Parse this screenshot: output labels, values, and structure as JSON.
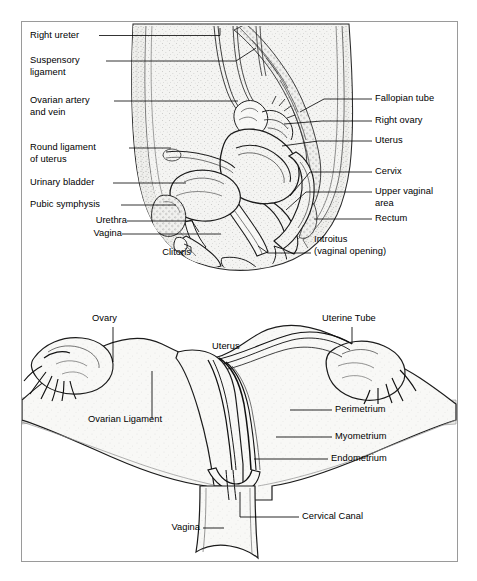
{
  "figure": {
    "kind": "anatomical-diagram",
    "title_visible": false,
    "panels": [
      {
        "id": "sagittal",
        "name": "Female pelvis, midsagittal section"
      },
      {
        "id": "coronal",
        "name": "Uterus, uterine tubes and ovaries, coronal section"
      }
    ],
    "colors": {
      "frame_border": "#9a9a9a",
      "background": "#ffffff",
      "ink": "#000000",
      "tissue_fill": "#f2f2f0",
      "shade_fill": "#e9e9e6",
      "leader_line": "#000000"
    }
  },
  "sagittal": {
    "left_labels": [
      {
        "key": "right_ureter",
        "text": "Right ureter"
      },
      {
        "key": "suspensory_ligament_l1",
        "text": "Suspensory"
      },
      {
        "key": "suspensory_ligament_l2",
        "text": "ligament"
      },
      {
        "key": "ovarian_artery_l1",
        "text": "Ovarian artery"
      },
      {
        "key": "ovarian_artery_l2",
        "text": "and vein"
      },
      {
        "key": "round_ligament_l1",
        "text": "Round ligament"
      },
      {
        "key": "round_ligament_l2",
        "text": "of uterus"
      },
      {
        "key": "urinary_bladder",
        "text": "Urinary bladder"
      },
      {
        "key": "pubic_symphysis",
        "text": "Pubic symphysis"
      },
      {
        "key": "urethra",
        "text": "Urethra"
      },
      {
        "key": "vagina",
        "text": "Vagina"
      },
      {
        "key": "clitoris",
        "text": "Clitoris"
      }
    ],
    "right_labels": [
      {
        "key": "fallopian_tube",
        "text": "Fallopian tube"
      },
      {
        "key": "right_ovary",
        "text": "Right ovary"
      },
      {
        "key": "uterus",
        "text": "Uterus"
      },
      {
        "key": "cervix",
        "text": "Cervix"
      },
      {
        "key": "upper_vaginal_l1",
        "text": "Upper vaginal"
      },
      {
        "key": "upper_vaginal_l2",
        "text": "area"
      },
      {
        "key": "rectum",
        "text": "Rectum"
      },
      {
        "key": "introitus_l1",
        "text": "Introitus"
      },
      {
        "key": "introitus_l2",
        "text": "(vaginal opening)"
      }
    ]
  },
  "coronal": {
    "labels": [
      {
        "key": "ovary",
        "text": "Ovary"
      },
      {
        "key": "uterine_tube",
        "text": "Uterine Tube"
      },
      {
        "key": "uterus",
        "text": "Uterus"
      },
      {
        "key": "ovarian_ligament",
        "text": "Ovarian Ligament"
      },
      {
        "key": "perimetrium",
        "text": "Perimetrium"
      },
      {
        "key": "myometrium",
        "text": "Myometrium"
      },
      {
        "key": "endometrium",
        "text": "Endometrium"
      },
      {
        "key": "cervical_canal",
        "text": "Cervical Canal"
      },
      {
        "key": "vagina",
        "text": "Vagina"
      }
    ]
  }
}
